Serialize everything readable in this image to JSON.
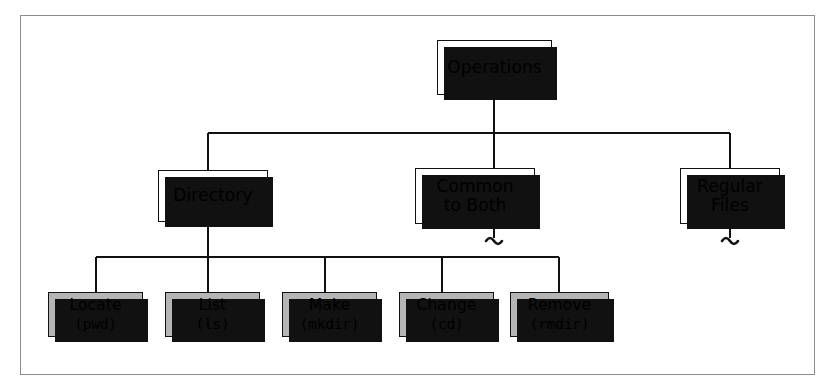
{
  "figure": {
    "type": "hierarchy-tree",
    "title": "Operations",
    "border_color": "#8c8c8c",
    "node_fill": "#ffffff",
    "leaf_fill": "#b5b5b5",
    "line_color": "#111111"
  },
  "root": {
    "label": "Operations",
    "x": 437,
    "y": 40,
    "w": 115,
    "h": 55
  },
  "branches": [
    {
      "label": "Directory",
      "lines": [
        "Directory"
      ],
      "x": 158,
      "y": 170,
      "w": 110,
      "h": 52,
      "has_squiggle": false
    },
    {
      "label": "Common to Both",
      "lines": [
        "Common",
        "to Both"
      ],
      "x": 415,
      "y": 168,
      "w": 120,
      "h": 56,
      "has_squiggle": true
    },
    {
      "label": "Regular Files",
      "lines": [
        "Regular",
        "Files"
      ],
      "x": 680,
      "y": 168,
      "w": 100,
      "h": 56,
      "has_squiggle": true
    }
  ],
  "leaves": [
    {
      "name": "Locate",
      "command": "(pwd)",
      "x": 48,
      "y": 292,
      "w": 95,
      "h": 45
    },
    {
      "name": "List",
      "command": "(ls)",
      "x": 165,
      "y": 292,
      "w": 95,
      "h": 45
    },
    {
      "name": "Make",
      "command": "(mkdir)",
      "x": 282,
      "y": 292,
      "w": 95,
      "h": 45
    },
    {
      "name": "Change",
      "command": "(cd)",
      "x": 399,
      "y": 292,
      "w": 95,
      "h": 45
    },
    {
      "name": "Remove",
      "command": "(rmdir)",
      "x": 510,
      "y": 292,
      "w": 99,
      "h": 45
    }
  ],
  "connectors": {
    "root_stem": {
      "x": 494,
      "y1": 95,
      "y2": 133
    },
    "bus_top": {
      "y": 133,
      "x1": 208,
      "x2": 730
    },
    "drop_directory": {
      "x": 208,
      "y1": 133,
      "y2": 170
    },
    "drop_common": {
      "x": 494,
      "y1": 133,
      "y2": 168
    },
    "drop_regular": {
      "x": 730,
      "y1": 133,
      "y2": 168
    },
    "directory_stem": {
      "x": 208,
      "y1": 222,
      "y2": 257
    },
    "bus_bottom": {
      "y": 257,
      "x1": 96,
      "x2": 559
    },
    "leaf_drops": [
      {
        "x": 96,
        "y1": 257,
        "y2": 292
      },
      {
        "x": 208,
        "y1": 257,
        "y2": 292
      },
      {
        "x": 325,
        "y1": 257,
        "y2": 292
      },
      {
        "x": 442,
        "y1": 257,
        "y2": 292
      },
      {
        "x": 559,
        "y1": 257,
        "y2": 292
      }
    ],
    "squiggles": [
      {
        "label": "common-to-both-continues",
        "x": 494,
        "y": 224
      },
      {
        "label": "regular-files-continues",
        "x": 730,
        "y": 224
      }
    ]
  }
}
